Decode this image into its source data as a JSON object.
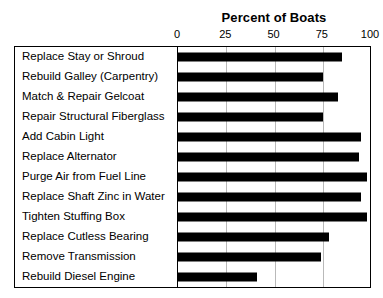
{
  "chart_data": {
    "type": "bar",
    "orientation": "horizontal",
    "title": "Percent of Boats",
    "xlabel": "",
    "ylabel": "",
    "xlim": [
      0,
      100
    ],
    "ticks": [
      0,
      25,
      50,
      75,
      100
    ],
    "grid": true,
    "legend": false,
    "categories": [
      "Replace Stay or Shroud",
      "Rebuild Galley (Carpentry)",
      "Match & Repair Gelcoat",
      "Repair Structural Fiberglass",
      "Add Cabin Light",
      "Replace Alternator",
      "Purge Air from Fuel Line",
      "Replace Shaft Zinc in Water",
      "Tighten Stuffing Box",
      "Replace Cutless Bearing",
      "Remove Transmission",
      "Rebuild Diesel Engine"
    ],
    "values": [
      85,
      75,
      83,
      75,
      95,
      94,
      98,
      95,
      98,
      78,
      74,
      41
    ],
    "bar_color": "#000000"
  }
}
